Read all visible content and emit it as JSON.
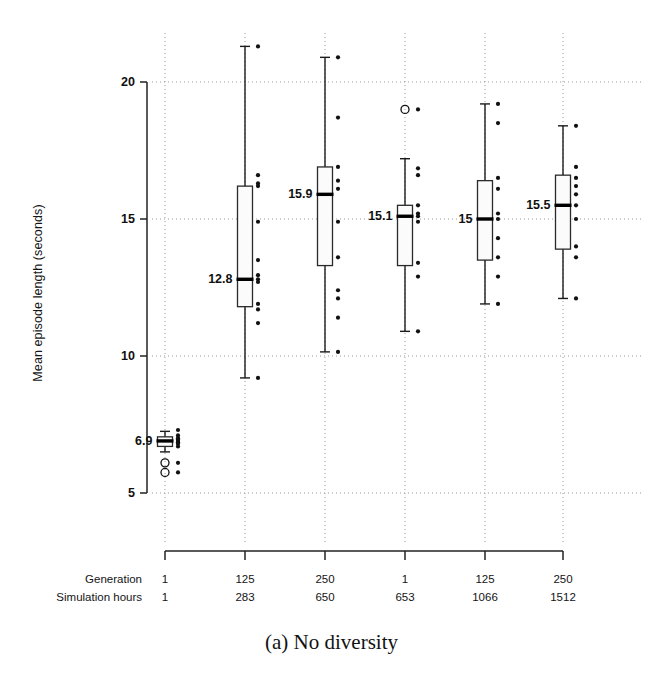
{
  "figure": {
    "caption": "(a) No diversity",
    "ylabel": "Mean episode length (seconds)",
    "row_labels": {
      "generation": "Generation",
      "simulation_hours": "Simulation hours"
    }
  },
  "chart_data": {
    "type": "box",
    "title": "",
    "xlabel": "",
    "ylabel": "Mean episode length (seconds)",
    "ylim": [
      4.2,
      22.0
    ],
    "yticks": [
      5,
      10,
      15,
      20
    ],
    "ytick_labels": [
      "5",
      "10",
      "15",
      "20"
    ],
    "grid": true,
    "legend": "none",
    "caption": "(a) No diversity",
    "categories": [
      "1",
      "125",
      "250",
      "1",
      "125",
      "250"
    ],
    "x_axis_rows": [
      {
        "name": "Generation",
        "values": [
          "1",
          "125",
          "250",
          "1",
          "125",
          "250"
        ]
      },
      {
        "name": "Simulation hours",
        "values": [
          "1",
          "283",
          "650",
          "653",
          "1066",
          "1512"
        ]
      }
    ],
    "median_labels": [
      "6.9",
      "12.8",
      "15.9",
      "15.1",
      "15",
      "15.5"
    ],
    "boxes": [
      {
        "generation": "1",
        "simulation_hours": "1",
        "median": 6.9,
        "q1": 6.7,
        "q3": 7.05,
        "whisker_low": 6.5,
        "whisker_high": 7.25,
        "outliers": [
          6.1,
          5.75
        ],
        "points": [
          7.3,
          7.1,
          7.0,
          6.95,
          6.9,
          6.85,
          6.8,
          6.7,
          6.1,
          5.75
        ]
      },
      {
        "generation": "125",
        "simulation_hours": "283",
        "median": 12.8,
        "q1": 11.8,
        "q3": 16.2,
        "whisker_low": 9.2,
        "whisker_high": 21.3,
        "outliers": [],
        "points": [
          21.3,
          16.6,
          16.3,
          16.2,
          14.9,
          13.5,
          12.95,
          12.8,
          12.7,
          11.9,
          11.7,
          11.2,
          9.2
        ]
      },
      {
        "generation": "250",
        "simulation_hours": "650",
        "median": 15.9,
        "q1": 13.3,
        "q3": 16.9,
        "whisker_low": 10.15,
        "whisker_high": 20.9,
        "outliers": [],
        "points": [
          20.9,
          18.7,
          16.9,
          16.4,
          16.1,
          14.9,
          13.6,
          12.4,
          12.1,
          11.4,
          10.15
        ]
      },
      {
        "generation": "1",
        "simulation_hours": "653",
        "median": 15.1,
        "q1": 13.3,
        "q3": 15.5,
        "whisker_low": 10.9,
        "whisker_high": 17.2,
        "outliers": [
          19.0
        ],
        "points": [
          19.0,
          16.85,
          16.6,
          15.5,
          15.2,
          15.1,
          14.9,
          13.4,
          12.9,
          10.9
        ]
      },
      {
        "generation": "125",
        "simulation_hours": "1066",
        "median": 15.0,
        "q1": 13.5,
        "q3": 16.4,
        "whisker_low": 11.9,
        "whisker_high": 19.2,
        "outliers": [],
        "points": [
          19.2,
          18.5,
          16.5,
          16.1,
          15.2,
          15.0,
          14.3,
          13.6,
          12.9,
          11.9
        ]
      },
      {
        "generation": "250",
        "simulation_hours": "1512",
        "median": 15.5,
        "q1": 13.9,
        "q3": 16.6,
        "whisker_low": 12.1,
        "whisker_high": 18.4,
        "outliers": [],
        "points": [
          18.4,
          16.9,
          16.5,
          16.2,
          15.9,
          15.5,
          15.0,
          14.0,
          13.6,
          12.1
        ]
      }
    ]
  }
}
